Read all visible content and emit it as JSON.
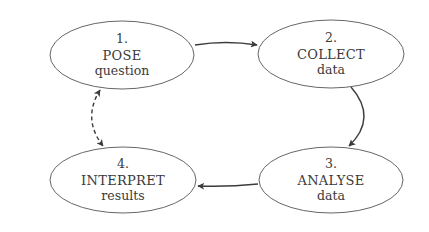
{
  "diagram": {
    "type": "cycle",
    "nodes": [
      {
        "id": "pose",
        "number": "1.",
        "verb": "POSE",
        "object": "question"
      },
      {
        "id": "collect",
        "number": "2.",
        "verb": "COLLECT",
        "object": "data"
      },
      {
        "id": "analyse",
        "number": "3.",
        "verb": "ANALYSE",
        "object": "data"
      },
      {
        "id": "interpret",
        "number": "4.",
        "verb": "INTERPRET",
        "object": "results"
      }
    ],
    "edges": [
      {
        "from": "pose",
        "to": "collect",
        "style": "solid",
        "direction": "forward"
      },
      {
        "from": "collect",
        "to": "analyse",
        "style": "solid",
        "direction": "forward"
      },
      {
        "from": "analyse",
        "to": "interpret",
        "style": "solid",
        "direction": "forward"
      },
      {
        "from": "interpret",
        "to": "pose",
        "style": "dashed",
        "direction": "both"
      }
    ],
    "colors": {
      "background": "#ffffff",
      "node_stroke": "#555555",
      "edge": "#3b3b3b",
      "text": "#3a3a3a"
    }
  }
}
